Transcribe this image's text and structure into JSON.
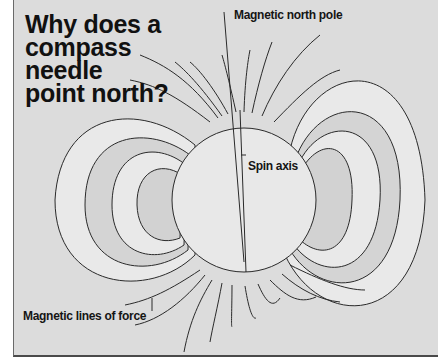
{
  "title": {
    "lines": [
      "Why does a",
      "compass",
      "needle",
      "point north?"
    ]
  },
  "labels": {
    "magnetic_north_pole": "Magnetic north pole",
    "spin_axis": "Spin axis",
    "magnetic_lines_of_force": "Magnetic lines of force"
  },
  "colors": {
    "background": "#dcdcdc",
    "earth_fill": "#e8e8e8",
    "band_light": "#e9e9e9",
    "band_dark": "#d2d2d2",
    "line": "#2a2a2a"
  }
}
